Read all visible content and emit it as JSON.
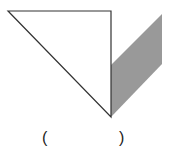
{
  "figure": {
    "shapes": [
      {
        "name": "triangle",
        "fill": "#ffffff",
        "stroke": "#333333"
      },
      {
        "name": "shaded-parallelogram",
        "fill": "#999999",
        "stroke": "none"
      }
    ]
  },
  "answer_blank": {
    "left_paren": "(",
    "right_paren": ")",
    "content": ""
  }
}
